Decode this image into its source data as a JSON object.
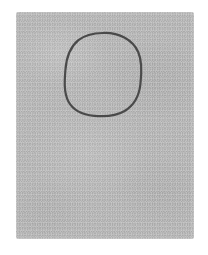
{
  "canvas": {
    "width": 208,
    "height": 255,
    "background_color": "#ffffff",
    "description": "Hand-drawn circle outline on a textured gray paper panel"
  },
  "paper_panel": {
    "name": "gray-paper-panel",
    "fill_color": "#b5b5b5",
    "x": 16,
    "y": 12,
    "width": 178,
    "height": 227,
    "edge_style": "feathered",
    "texture": "grainy-paper"
  },
  "shapes": [
    {
      "name": "circle-outline",
      "type": "circle",
      "stroke_color": "#4a4a4a",
      "fill": "none",
      "stroke_width": 2.2,
      "center_x": 103,
      "center_y": 74.5,
      "radius_x": 38,
      "radius_y": 41.5,
      "style": "hand-drawn-squircle",
      "path": "M 103.0 33.0 C 119.5 32.4 132.8 40.0 138.2 52.0 C 142.4 61.4 141.6 73.8 140.4 84.4 C 139.1 95.6 134.0 105.4 124.6 111.0 C 116.0 116.1 104.4 116.8 94.2 115.8 C 83.0 114.7 73.2 110.4 68.4 101.4 C 63.6 92.4 64.6 80.2 65.4 70.0 C 66.3 58.6 69.6 47.4 78.4 40.2 C 85.2 34.6 94.0 33.2 103.0 33.0 Z"
    }
  ]
}
